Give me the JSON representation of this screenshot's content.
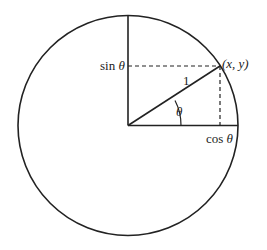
{
  "diagram": {
    "labels": {
      "sin": "sin",
      "cos": "cos",
      "theta": "θ",
      "radius": "1",
      "point": "(x, y)"
    },
    "colors": {
      "stroke": "#222222",
      "background": "#ffffff"
    }
  }
}
